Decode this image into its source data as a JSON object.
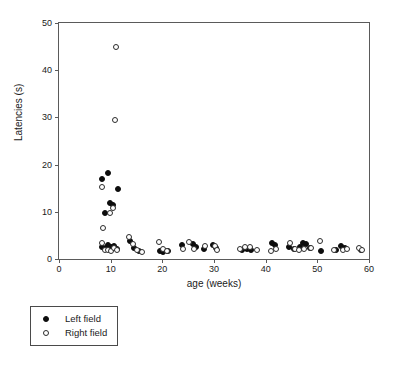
{
  "figure": {
    "background_color": "#ffffff",
    "axis_color": "#5a5a5a"
  },
  "axes": {
    "x_title": "age (weeks)",
    "y_title": "Latencies (s)",
    "x_ticks": [
      "0",
      "10",
      "20",
      "30",
      "40",
      "50",
      "60"
    ],
    "y_ticks": [
      "0",
      "10",
      "20",
      "30",
      "40",
      "50"
    ]
  },
  "legend": {
    "items": [
      {
        "label": "Left field",
        "marker": "filled-circle",
        "color": "#0d0d0d"
      },
      {
        "label": "Right field",
        "marker": "open-circle",
        "color": "#2b2b2b"
      }
    ]
  },
  "caption": {
    "text": ""
  },
  "chart_data": {
    "type": "scatter",
    "title": "",
    "subtitle": "",
    "xlabel": "age (weeks)",
    "ylabel": "Latencies (s)",
    "xlim": [
      0,
      60
    ],
    "ylim": [
      0,
      50
    ],
    "xticks": [
      0,
      10,
      20,
      30,
      40,
      50,
      60
    ],
    "yticks": [
      0,
      10,
      20,
      30,
      40,
      50
    ],
    "grid": false,
    "legend_position": "below-left",
    "series": [
      {
        "name": "Left field",
        "marker": "filled-circle",
        "color": "#0d0d0d",
        "points": [
          [
            8.4,
            17.0
          ],
          [
            9.4,
            18.2
          ],
          [
            11.5,
            14.8
          ],
          [
            9.8,
            11.8
          ],
          [
            8.9,
            9.8
          ],
          [
            10.5,
            11.4
          ],
          [
            8.4,
            2.6
          ],
          [
            9.0,
            2.4
          ],
          [
            9.5,
            3.0
          ],
          [
            10.1,
            2.5
          ],
          [
            10.6,
            2.7
          ],
          [
            11.2,
            2.2
          ],
          [
            13.8,
            3.8
          ],
          [
            14.6,
            2.4
          ],
          [
            15.5,
            1.7
          ],
          [
            19.6,
            1.6
          ],
          [
            20.2,
            1.5
          ],
          [
            21.0,
            1.7
          ],
          [
            23.8,
            2.9
          ],
          [
            25.9,
            3.2
          ],
          [
            26.5,
            2.5
          ],
          [
            28.0,
            2.2
          ],
          [
            29.8,
            3.0
          ],
          [
            30.4,
            2.4
          ],
          [
            35.4,
            1.9
          ],
          [
            36.3,
            2.1
          ],
          [
            37.2,
            2.0
          ],
          [
            41.3,
            3.4
          ],
          [
            41.8,
            2.9
          ],
          [
            44.6,
            2.6
          ],
          [
            45.4,
            2.2
          ],
          [
            46.6,
            2.6
          ],
          [
            47.2,
            3.3
          ],
          [
            47.9,
            3.1
          ],
          [
            48.6,
            2.4
          ],
          [
            50.8,
            1.8
          ],
          [
            53.6,
            2.0
          ],
          [
            54.5,
            2.7
          ],
          [
            55.3,
            2.3
          ],
          [
            58.4,
            1.9
          ]
        ]
      },
      {
        "name": "Right field",
        "marker": "open-circle",
        "color": "#2b2b2b",
        "points": [
          [
            11.0,
            45.0
          ],
          [
            10.9,
            29.4
          ],
          [
            8.4,
            15.2
          ],
          [
            10.4,
            10.7
          ],
          [
            9.9,
            9.7
          ],
          [
            8.6,
            6.6
          ],
          [
            8.3,
            3.4
          ],
          [
            8.9,
            1.9
          ],
          [
            9.4,
            2.0
          ],
          [
            10.0,
            1.8
          ],
          [
            10.7,
            2.3
          ],
          [
            11.3,
            2.0
          ],
          [
            13.6,
            4.7
          ],
          [
            14.3,
            3.1
          ],
          [
            15.1,
            2.0
          ],
          [
            16.0,
            1.5
          ],
          [
            19.4,
            3.5
          ],
          [
            20.1,
            2.1
          ],
          [
            20.9,
            1.8
          ],
          [
            24.0,
            2.1
          ],
          [
            25.2,
            3.6
          ],
          [
            26.2,
            2.1
          ],
          [
            28.2,
            2.7
          ],
          [
            30.2,
            2.8
          ],
          [
            30.6,
            1.9
          ],
          [
            35.0,
            2.2
          ],
          [
            36.0,
            2.6
          ],
          [
            36.9,
            2.5
          ],
          [
            38.4,
            1.9
          ],
          [
            41.0,
            1.8
          ],
          [
            42.0,
            2.1
          ],
          [
            44.8,
            3.4
          ],
          [
            45.6,
            2.2
          ],
          [
            46.4,
            2.0
          ],
          [
            47.5,
            2.1
          ],
          [
            48.8,
            2.4
          ],
          [
            50.6,
            3.9
          ],
          [
            53.2,
            1.9
          ],
          [
            54.9,
            2.0
          ],
          [
            55.8,
            2.1
          ],
          [
            58.1,
            2.4
          ],
          [
            58.6,
            2.0
          ]
        ]
      }
    ]
  }
}
